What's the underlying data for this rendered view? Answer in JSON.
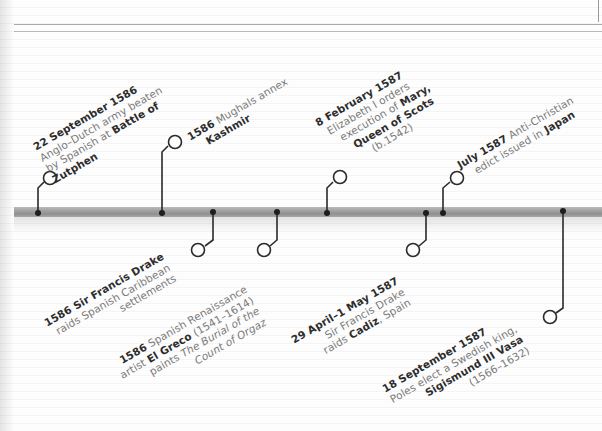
{
  "theme": {
    "bar_color": "#9d9d9d",
    "connector_color": "#2a2a2a",
    "date_color": "#2c2c2c",
    "body_text_color": "#7a7a7a"
  },
  "events": [
    {
      "date": "22 September 1586",
      "lines": [
        [
          {
            "t": "Anglo–Dutch army beaten"
          }
        ],
        [
          {
            "t": "by Spanish at "
          },
          {
            "t": "Battle of",
            "b": true
          }
        ],
        [
          {
            "t": "Zutphen",
            "b": true
          }
        ]
      ],
      "position": "above"
    },
    {
      "date": "1586",
      "lines": [
        [
          {
            "t": "1586",
            "b": true
          },
          {
            "t": " Mughals annex"
          }
        ],
        [
          {
            "t": "Kashmir",
            "b": true
          }
        ]
      ],
      "position": "above"
    },
    {
      "date": "8 February 1587",
      "lines": [
        [
          {
            "t": "Elizabeth I orders"
          }
        ],
        [
          {
            "t": "execution of "
          },
          {
            "t": "Mary,",
            "b": true
          }
        ],
        [
          {
            "t": "Queen of Scots",
            "b": true
          }
        ],
        [
          {
            "t": "(b.1542)"
          }
        ]
      ],
      "position": "above"
    },
    {
      "date": "July 1587",
      "lines": [
        [
          {
            "t": "July 1587",
            "b": true
          },
          {
            "t": " Anti-Christian"
          }
        ],
        [
          {
            "t": "edict issued in "
          },
          {
            "t": "Japan",
            "b": true
          }
        ]
      ],
      "position": "above"
    },
    {
      "date": "1586",
      "lines": [
        [
          {
            "t": "1586 Sir Francis Drake",
            "b": true
          }
        ],
        [
          {
            "t": "raids Spanish Caribbean"
          }
        ],
        [
          {
            "t": "settlements"
          }
        ]
      ],
      "position": "below"
    },
    {
      "date": "1586",
      "lines": [
        [
          {
            "t": "1586",
            "b": true
          },
          {
            "t": " Spanish Renaissance"
          }
        ],
        [
          {
            "t": "artist "
          },
          {
            "t": "El Greco",
            "b": true
          },
          {
            "t": " (1541–1614)"
          }
        ],
        [
          {
            "t": "paints "
          },
          {
            "t": "The Burial of the",
            "i": true
          }
        ],
        [
          {
            "t": "Count of Orgaz",
            "i": true
          }
        ]
      ],
      "position": "below"
    },
    {
      "date": "29 April–1 May 1587",
      "lines": [
        [
          {
            "t": "Sir Francis Drake"
          }
        ],
        [
          {
            "t": "raids "
          },
          {
            "t": "Cadiz",
            "b": true
          },
          {
            "t": ", Spain"
          }
        ]
      ],
      "position": "below"
    },
    {
      "date": "18 September 1587",
      "lines": [
        [
          {
            "t": "Poles elect a Swedish king,"
          }
        ],
        [
          {
            "t": "Sigismund III Vasa",
            "b": true
          }
        ],
        [
          {
            "t": "(1566–1632)"
          }
        ]
      ],
      "position": "below"
    }
  ],
  "labels": {
    "e1_date": "22 September 1586",
    "e1_l1": "Anglo–Dutch army beaten",
    "e1_l2a": "by Spanish at ",
    "e1_l2b": "Battle of",
    "e1_l3": "Zutphen",
    "e2_date": "1586",
    "e2_l1": " Mughals annex",
    "e2_l2": "Kashmir",
    "e3_date": "8 February 1587",
    "e3_l1": "Elizabeth I orders",
    "e3_l2a": "execution of ",
    "e3_l2b": "Mary,",
    "e3_l3": "Queen of Scots",
    "e3_l4": "(b.1542)",
    "e4_date": "July 1587",
    "e4_l1": " Anti-Christian",
    "e4_l2a": "edict issued in ",
    "e4_l2b": "Japan",
    "e5_date": "1586 Sir Francis Drake",
    "e5_l1": "raids Spanish Caribbean",
    "e5_l2": "settlements",
    "e6_date": "1586",
    "e6_l1": " Spanish Renaissance",
    "e6_l2a": "artist ",
    "e6_l2b": "El Greco",
    "e6_l2c": " (1541–1614)",
    "e6_l3a": "paints ",
    "e6_l3b": "The Burial of the",
    "e6_l4": "Count of Orgaz",
    "e7_date": "29 April–1 May 1587",
    "e7_l1": "Sir Francis Drake",
    "e7_l2a": "raids ",
    "e7_l2b": "Cadiz",
    "e7_l2c": ", Spain",
    "e8_date": "18 September 1587",
    "e8_l1": "Poles elect a Swedish king,",
    "e8_l2": "Sigismund III Vasa",
    "e8_l3": "(1566–1632)"
  }
}
